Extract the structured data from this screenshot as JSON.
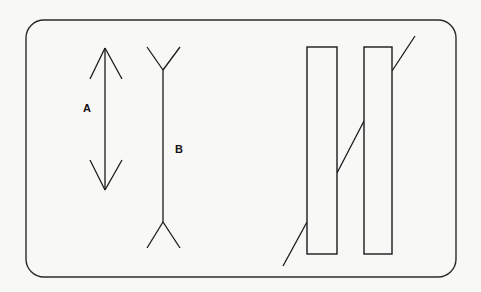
{
  "page": {
    "background_color": "#f8f8f7",
    "width": 481,
    "height": 292
  },
  "panel": {
    "name": "rounded-rectangle-frame",
    "x": 26,
    "y": 20,
    "width": 430,
    "height": 257,
    "corner_radius": 18,
    "stroke_color": "#2b2b2b",
    "stroke_width": 1.4,
    "fill": "none"
  },
  "figures": [
    {
      "id": "A",
      "name": "muller-lyer-arrows-in",
      "label": "A",
      "label_x": 87,
      "label_y": 109,
      "shaft": {
        "x": 105,
        "y1": 48,
        "y2": 190
      },
      "fins": [
        {
          "from": [
            105,
            48
          ],
          "to": [
            90,
            79
          ]
        },
        {
          "from": [
            105,
            48
          ],
          "to": [
            122,
            79
          ]
        },
        {
          "from": [
            105,
            190
          ],
          "to": [
            90,
            160
          ]
        },
        {
          "from": [
            105,
            190
          ],
          "to": [
            122,
            160
          ]
        }
      ],
      "stroke_color": "#1a1a1a",
      "stroke_width": 1.3
    },
    {
      "id": "B",
      "name": "muller-lyer-fins-out",
      "label": "B",
      "label_x": 179,
      "label_y": 150,
      "shaft": {
        "x": 163,
        "y1": 70,
        "y2": 222
      },
      "fins": [
        {
          "from": [
            163,
            70
          ],
          "to": [
            147,
            47
          ]
        },
        {
          "from": [
            163,
            70
          ],
          "to": [
            180,
            47
          ]
        },
        {
          "from": [
            163,
            222
          ],
          "to": [
            147,
            248
          ]
        },
        {
          "from": [
            163,
            222
          ],
          "to": [
            180,
            248
          ]
        }
      ],
      "stroke_color": "#1a1a1a",
      "stroke_width": 1.3
    },
    {
      "id": "C",
      "name": "poggendorff-bars-and-diagonal",
      "bars": [
        {
          "name": "bar-left",
          "x": 307,
          "y": 47,
          "width": 30,
          "height": 207
        },
        {
          "name": "bar-right",
          "x": 364,
          "y": 47,
          "width": 28,
          "height": 207
        }
      ],
      "diagonal_segments": [
        {
          "name": "diagonal-upper",
          "from": [
            392,
            71
          ],
          "to": [
            415,
            36
          ]
        },
        {
          "name": "diagonal-middle",
          "from": [
            337,
            173
          ],
          "to": [
            364,
            121
          ]
        },
        {
          "name": "diagonal-lower",
          "from": [
            307,
            222
          ],
          "to": [
            283,
            266
          ]
        }
      ],
      "stroke_color": "#1a1a1a",
      "stroke_width": 1.3
    }
  ]
}
